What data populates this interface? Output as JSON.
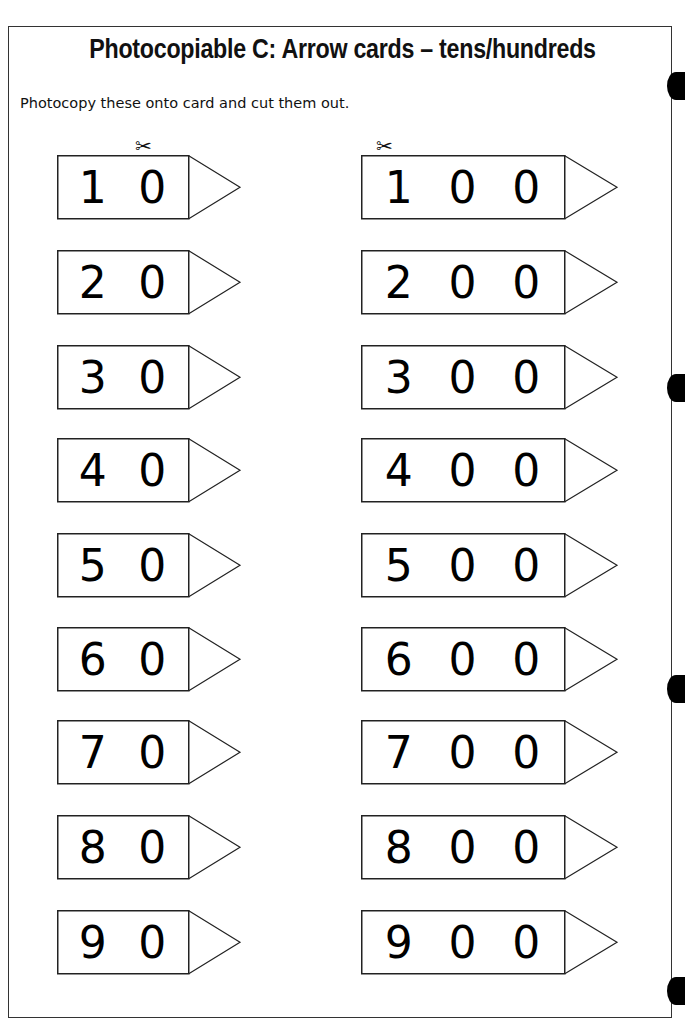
{
  "page": {
    "title": "Photocopiable C:  Arrow cards – tens/hundreds",
    "instruction": "Photocopy these onto card and cut them out.",
    "scissors_icon": "✂"
  },
  "tens_cards": [
    {
      "label": "10",
      "digits": [
        "1",
        "0"
      ]
    },
    {
      "label": "20",
      "digits": [
        "2",
        "0"
      ]
    },
    {
      "label": "30",
      "digits": [
        "3",
        "0"
      ]
    },
    {
      "label": "40",
      "digits": [
        "4",
        "0"
      ]
    },
    {
      "label": "50",
      "digits": [
        "5",
        "0"
      ]
    },
    {
      "label": "60",
      "digits": [
        "6",
        "0"
      ]
    },
    {
      "label": "70",
      "digits": [
        "7",
        "0"
      ]
    },
    {
      "label": "80",
      "digits": [
        "8",
        "0"
      ]
    },
    {
      "label": "90",
      "digits": [
        "9",
        "0"
      ]
    }
  ],
  "hundreds_cards": [
    {
      "label": "100",
      "digits": [
        "1",
        "0",
        "0"
      ]
    },
    {
      "label": "200",
      "digits": [
        "2",
        "0",
        "0"
      ]
    },
    {
      "label": "300",
      "digits": [
        "3",
        "0",
        "0"
      ]
    },
    {
      "label": "400",
      "digits": [
        "4",
        "0",
        "0"
      ]
    },
    {
      "label": "500",
      "digits": [
        "5",
        "0",
        "0"
      ]
    },
    {
      "label": "600",
      "digits": [
        "6",
        "0",
        "0"
      ]
    },
    {
      "label": "700",
      "digits": [
        "7",
        "0",
        "0"
      ]
    },
    {
      "label": "800",
      "digits": [
        "8",
        "0",
        "0"
      ]
    },
    {
      "label": "900",
      "digits": [
        "9",
        "0",
        "0"
      ]
    }
  ]
}
